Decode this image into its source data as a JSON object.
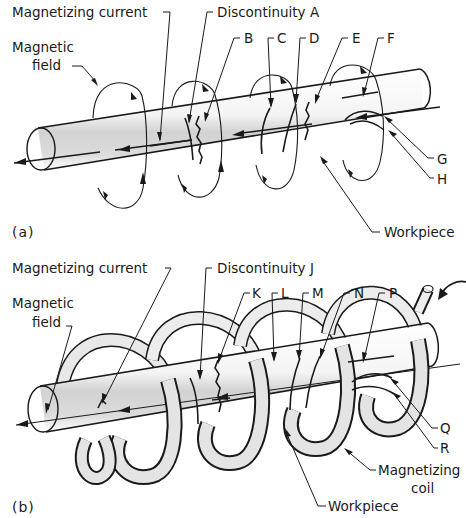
{
  "figure": {
    "panel_a": {
      "tag": "(a)",
      "title_implied": "Circular magnetization",
      "labels": {
        "magnetizing_current": "Magnetizing current",
        "magnetic_field_line1": "Magnetic",
        "magnetic_field_line2": "field",
        "discontinuity": "Discontinuity A",
        "B": "B",
        "C": "C",
        "D": "D",
        "E": "E",
        "F": "F",
        "G": "G",
        "H": "H",
        "workpiece": "Workpiece"
      }
    },
    "panel_b": {
      "tag": "(b)",
      "title_implied": "Longitudinal magnetization",
      "labels": {
        "magnetizing_current": "Magnetizing current",
        "magnetic_field_line1": "Magnetic",
        "magnetic_field_line2": "field",
        "discontinuity": "Discontinuity J",
        "K": "K",
        "L": "L",
        "M": "M",
        "N": "N",
        "P": "P",
        "Q": "Q",
        "R": "R",
        "coil_line1": "Magnetizing",
        "coil_line2": "coil",
        "workpiece": "Workpiece"
      }
    },
    "colors": {
      "ink": "#1a1a1a",
      "shade": "#d4d4d4",
      "background": "#ffffff"
    }
  }
}
